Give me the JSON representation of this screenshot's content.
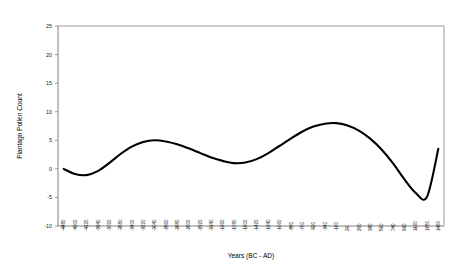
{
  "chart_data": {
    "type": "line",
    "title": "",
    "xlabel": "Years (BC - AD)",
    "ylabel": "Plantago Pollen Count",
    "ylim": [
      -10,
      25
    ],
    "ytick_values": [
      25,
      20,
      15,
      10,
      5,
      0,
      -5,
      -10
    ],
    "ytick_labels": [
      "25",
      "20",
      "15",
      "10",
      "5",
      "0",
      "-5",
      "-10"
    ],
    "grid": false,
    "legend": "none",
    "categories": [
      "-4480",
      "-4300",
      "-4120",
      "-3940",
      "-3760",
      "-3580",
      "-3400",
      "-3220",
      "-3040",
      "-2860",
      "-2680",
      "-2500",
      "-2320",
      "-2140",
      "-1960",
      "-1780",
      "-1600",
      "-1420",
      "-1240",
      "-1060",
      "-880",
      "-700",
      "-520",
      "-340",
      "-160",
      "20",
      "200",
      "380",
      "560",
      "740",
      "920",
      "1100",
      "1280",
      "1460"
    ],
    "xtick_labels": [
      "-4480",
      "-4300",
      "-4120",
      "-3940",
      "-3760",
      "-3580",
      "-3400",
      "-3220",
      "-3040",
      "-2860",
      "-2680",
      "-2500",
      "-2320",
      "-2140",
      "-1960",
      "-1780",
      "-1600",
      "-1420",
      "-1240",
      "-1060",
      "-880",
      "-700",
      "-520",
      "-340",
      "-160",
      "20",
      "200",
      "380",
      "560",
      "740",
      "920",
      "1100",
      "1280",
      "1460"
    ],
    "values": [
      0.0,
      -0.9,
      -1.1,
      -0.4,
      1.0,
      2.6,
      3.9,
      4.7,
      5.0,
      4.8,
      4.3,
      3.6,
      2.8,
      2.0,
      1.4,
      1.0,
      1.1,
      1.7,
      2.7,
      4.0,
      5.3,
      6.5,
      7.4,
      7.9,
      8.0,
      7.6,
      6.7,
      5.3,
      3.4,
      1.0,
      -1.8,
      -4.2,
      -4.9,
      3.5
    ],
    "series_name": "Plantago Pollen Count",
    "line_color": "#000000"
  }
}
